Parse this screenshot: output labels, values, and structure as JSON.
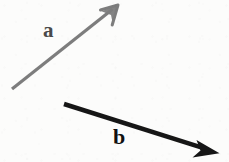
{
  "figure": {
    "background_color": "#fcfcfb",
    "width": 229,
    "height": 162
  },
  "chart_data": {
    "type": "diagram",
    "title": "",
    "subtitle": "",
    "xlabel": "",
    "ylabel": "",
    "coordinate_space": "pixels, origin at top-left of a 229x162 image",
    "vectors": [
      {
        "name": "a",
        "label": "a",
        "color": "#7d7d7d",
        "label_color": "#4a4a4a",
        "tail": [
          12,
          89
        ],
        "tip": [
          118,
          5
        ],
        "dx": 106,
        "dy": -84,
        "length": 135.3,
        "angle_degrees": 38.4,
        "stroke_width": 3.2,
        "arrowhead_style": "open-barbed",
        "label_position": [
          43,
          20
        ]
      },
      {
        "name": "b",
        "label": "b",
        "color": "#161616",
        "label_color": "#111111",
        "tail": [
          64,
          104
        ],
        "tip": [
          219,
          153
        ],
        "dx": 155,
        "dy": 49,
        "length": 162.6,
        "angle_degrees": -17.5,
        "stroke_width": 4.6,
        "arrowhead_style": "solid-triangle",
        "label_position": [
          113,
          126
        ]
      }
    ],
    "legend": [],
    "grid": false,
    "axes_visible": false
  },
  "labels": {
    "a": "a",
    "b": "b"
  },
  "colors": {
    "vector_a": "#7d7d7d",
    "vector_b": "#161616",
    "background": "#fcfcfb",
    "label_a": "#4a4a4a",
    "label_b": "#111111"
  }
}
